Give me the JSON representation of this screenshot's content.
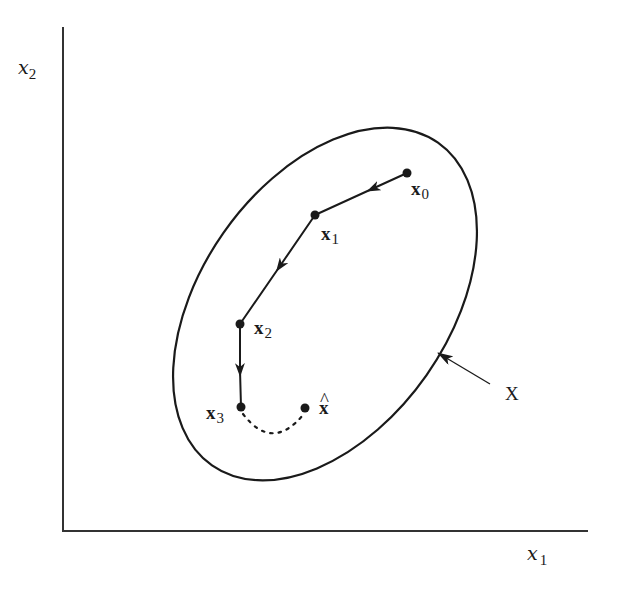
{
  "diagram": {
    "axes": {
      "x_label": "x",
      "x_label_sub": "1",
      "y_label": "x",
      "y_label_sub": "2"
    },
    "region": {
      "label": "X",
      "shape": "ellipse"
    },
    "points": [
      {
        "id": "x0",
        "label": "x",
        "sub": "0",
        "x": 407,
        "y": 173
      },
      {
        "id": "x1",
        "label": "x",
        "sub": "1",
        "x": 315,
        "y": 215
      },
      {
        "id": "x2",
        "label": "x",
        "sub": "2",
        "x": 240,
        "y": 324
      },
      {
        "id": "x3",
        "label": "x",
        "sub": "3",
        "x": 241,
        "y": 407
      },
      {
        "id": "xhat",
        "label": "x",
        "hat": "^",
        "x": 305,
        "y": 408
      }
    ],
    "path": [
      "x0",
      "x1",
      "x2",
      "x3"
    ],
    "dotted_connection": [
      "x3",
      "xhat"
    ],
    "colors": {
      "ink": "#1a1a1a",
      "background": "#ffffff"
    }
  }
}
